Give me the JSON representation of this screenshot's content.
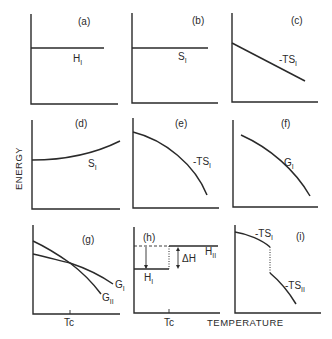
{
  "figure": {
    "ylabel": "ENERGY",
    "xlabel": "TEMPERATURE",
    "panels": [
      {
        "id": "a",
        "label": "(a)",
        "curve": "H",
        "subscript": "I",
        "shape": "constant"
      },
      {
        "id": "b",
        "label": "(b)",
        "curve": "S",
        "subscript": "I",
        "shape": "constant"
      },
      {
        "id": "c",
        "label": "(c)",
        "curve": "-TS",
        "subscript": "I",
        "shape": "linear-decreasing"
      },
      {
        "id": "d",
        "label": "(d)",
        "curve": "S",
        "subscript": "I",
        "shape": "increasing-convex"
      },
      {
        "id": "e",
        "label": "(e)",
        "curve": "-TS",
        "subscript": "I",
        "shape": "decreasing-concave"
      },
      {
        "id": "f",
        "label": "(f)",
        "curve": "G",
        "subscript": "I",
        "shape": "decreasing-concave"
      },
      {
        "id": "g",
        "label": "(g)",
        "curves": [
          {
            "name": "G",
            "subscript": "I"
          },
          {
            "name": "G",
            "subscript": "II"
          }
        ],
        "tick": "Tc",
        "shape": "crossing-at-Tc"
      },
      {
        "id": "h",
        "label": "(h)",
        "curves": [
          {
            "name": "H",
            "subscript": "I"
          },
          {
            "name": "H",
            "subscript": "II"
          }
        ],
        "delta": "ΔH",
        "tick": "Tc",
        "shape": "step-at-Tc"
      },
      {
        "id": "i",
        "label": "(i)",
        "curves": [
          {
            "name": "-TS",
            "subscript": "I"
          },
          {
            "name": "-TS",
            "subscript": "II"
          }
        ],
        "shape": "discontinuous-at-Tc"
      }
    ]
  },
  "text": {
    "a": {
      "label": "(a)",
      "name": "H",
      "sub": "I"
    },
    "b": {
      "label": "(b)",
      "name": "S",
      "sub": "I"
    },
    "c": {
      "label": "(c)",
      "name": "-TS",
      "sub": "I"
    },
    "d": {
      "label": "(d)",
      "name": "S",
      "sub": "I"
    },
    "e": {
      "label": "(e)",
      "name": "-TS",
      "sub": "I"
    },
    "f": {
      "label": "(f)",
      "name": "G",
      "sub": "I"
    },
    "g": {
      "label": "(g)",
      "name1": "G",
      "sub1": "I",
      "name2": "G",
      "sub2": "II",
      "tick": "Tc"
    },
    "h": {
      "label": "(h)",
      "name1": "H",
      "sub1": "I",
      "name2": "H",
      "sub2": "II",
      "delta": "ΔH",
      "tick": "Tc"
    },
    "i": {
      "label": "(i)",
      "name1": "-TS",
      "sub1": "I",
      "name2": "-TS",
      "sub2": "II"
    },
    "ylabel": "ENERGY",
    "xlabel": "TEMPERATURE"
  }
}
